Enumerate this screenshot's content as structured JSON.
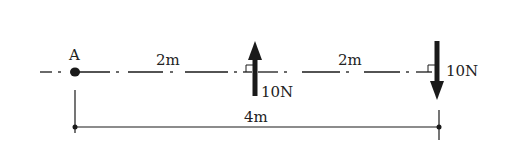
{
  "diagram": {
    "point_label": "A",
    "segment_left_label": "2m",
    "segment_right_label": "2m",
    "total_length_label": "4m",
    "forces": [
      {
        "label": "10N",
        "direction": "up",
        "position": "2m from A"
      },
      {
        "label": "10N",
        "direction": "down",
        "position": "4m from A"
      }
    ],
    "colors": {
      "ink": "#1a1a1a",
      "background": "#ffffff"
    }
  }
}
